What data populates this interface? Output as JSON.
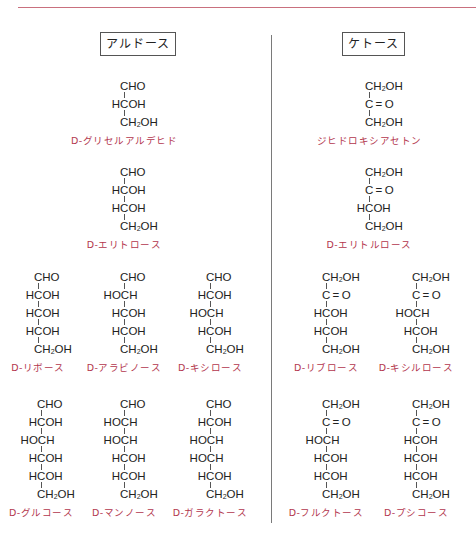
{
  "headings": {
    "aldoses": "アルドース",
    "ketoses": "ケトース"
  },
  "colors": {
    "rule": "#c9707e",
    "label": "#b3364d",
    "divider": "#7a7a7a"
  },
  "aldoses": [
    {
      "name": "D-グリセルアルデヒド",
      "rows": [
        "CHO",
        "HCOH",
        "CH2OH"
      ],
      "x": 120,
      "y": 80
    },
    {
      "name": "D-エリトロース",
      "rows": [
        "CHO",
        "HCOH",
        "HCOH",
        "CH2OH"
      ],
      "x": 120,
      "y": 166
    },
    {
      "name": "D-リボース",
      "rows": [
        "CHO",
        "HCOH",
        "HCOH",
        "HCOH",
        "CH2OH"
      ],
      "x": 34,
      "y": 271
    },
    {
      "name": "D-アラビノース",
      "rows": [
        "CHO",
        "HOCH",
        "HCOH",
        "HCOH",
        "CH2OH"
      ],
      "x": 120,
      "y": 271
    },
    {
      "name": "D-キシロース",
      "rows": [
        "CHO",
        "HCOH",
        "HOCH",
        "HCOH",
        "CH2OH"
      ],
      "x": 206,
      "y": 271
    },
    {
      "name": "D-グルコース",
      "rows": [
        "CHO",
        "HCOH",
        "HOCH",
        "HCOH",
        "HCOH",
        "CH2OH"
      ],
      "x": 37,
      "y": 398
    },
    {
      "name": "D-マンノース",
      "rows": [
        "CHO",
        "HOCH",
        "HOCH",
        "HCOH",
        "HCOH",
        "CH2OH"
      ],
      "x": 120,
      "y": 398
    },
    {
      "name": "D-ガラクトース",
      "rows": [
        "CHO",
        "HCOH",
        "HOCH",
        "HOCH",
        "HCOH",
        "CH2OH"
      ],
      "x": 206,
      "y": 398
    }
  ],
  "ketoses": [
    {
      "name": "ジヒドロキシアセトン",
      "rows": [
        "CH2OH",
        "C=O",
        "CH2OH"
      ],
      "x": 365,
      "y": 80
    },
    {
      "name": "D-エリトルロース",
      "rows": [
        "CH2OH",
        "C=O",
        "HCOH",
        "CH2OH"
      ],
      "x": 365,
      "y": 166
    },
    {
      "name": "D-リブロース",
      "rows": [
        "CH2OH",
        "C=O",
        "HCOH",
        "HCOH",
        "CH2OH"
      ],
      "x": 322,
      "y": 271
    },
    {
      "name": "D-キシルロース",
      "rows": [
        "CH2OH",
        "C=O",
        "HOCH",
        "HCOH",
        "CH2OH"
      ],
      "x": 412,
      "y": 271
    },
    {
      "name": "D-フルクトース",
      "rows": [
        "CH2OH",
        "C=O",
        "HOCH",
        "HCOH",
        "HCOH",
        "CH2OH"
      ],
      "x": 322,
      "y": 398
    },
    {
      "name": "D-プシコース",
      "rows": [
        "CH2OH",
        "C=O",
        "HCOH",
        "HCOH",
        "HCOH",
        "CH2OH"
      ],
      "x": 412,
      "y": 398
    }
  ]
}
